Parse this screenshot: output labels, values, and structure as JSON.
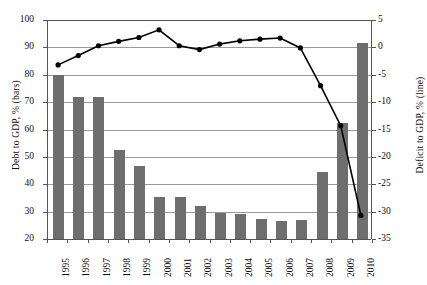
{
  "chart_data": {
    "type": "bar",
    "title": "",
    "categories": [
      "1995",
      "1996",
      "1997",
      "1998",
      "1999",
      "2000",
      "2001",
      "2002",
      "2003",
      "2004",
      "2005",
      "2006",
      "2007",
      "2008",
      "2009",
      "2010"
    ],
    "series": [
      {
        "name": "Debt to GDP, % (bars)",
        "kind": "bar",
        "axis": "left",
        "color": "#6e6e6e",
        "values": [
          80.0,
          72.0,
          72.0,
          52.5,
          46.8,
          35.3,
          35.2,
          32.0,
          29.5,
          29.0,
          27.4,
          26.6,
          26.9,
          44.5,
          62.5,
          91.5
        ]
      },
      {
        "name": "Deficit to GDP, % (line)",
        "kind": "line",
        "axis": "right",
        "color": "#000000",
        "values": [
          -3.2,
          -1.5,
          0.3,
          1.1,
          1.8,
          3.2,
          0.3,
          -0.4,
          0.6,
          1.2,
          1.5,
          1.7,
          -0.1,
          -7.0,
          -14.3,
          -30.7
        ]
      }
    ],
    "xlabel": "",
    "ylabel": "Debt to GDP, % (bars)",
    "y2label": "Deficit to GDP, % (line)",
    "ylim": [
      20,
      100
    ],
    "y2lim": [
      -35,
      5
    ],
    "yticks": [
      "100",
      "90",
      "80",
      "70",
      "60",
      "50",
      "40",
      "30",
      "20"
    ],
    "y2ticks": [
      "5",
      "0",
      "-5",
      "-10",
      "-15",
      "-20",
      "-25",
      "-30",
      "-35"
    ],
    "grid": true,
    "legend": "none"
  },
  "axes": {
    "left_title": "Debt to GDP, % (bars)",
    "right_title": "Deficit to GDP, % (line)"
  }
}
